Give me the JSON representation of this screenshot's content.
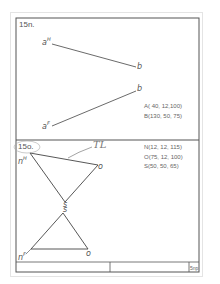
{
  "problem_a": {
    "title": "15n.",
    "points": {
      "aH": {
        "base": "a",
        "sup": "H"
      },
      "aF": {
        "base": "a",
        "sup": "F"
      },
      "bH": "b",
      "bF": "b"
    },
    "coords": [
      "A( 40, 12,100)",
      "B(130, 50, 75)"
    ]
  },
  "problem_b": {
    "title": "15o.",
    "annotation": "TL",
    "points": {
      "nH": {
        "base": "n",
        "sup": "H"
      },
      "oH": "o",
      "sH": "s",
      "sF": "s",
      "nF": {
        "base": "n",
        "sup": "F"
      },
      "oF": "o"
    },
    "coords": [
      "N(12, 12, 115)",
      "O(75, 12, 100)",
      "S(50, 50, 65)"
    ]
  },
  "title_block": {
    "cells": [
      "",
      "",
      "5np"
    ]
  },
  "colors": {
    "line": "#444444",
    "frame": "#555555",
    "faint": "#e4e4e4"
  }
}
